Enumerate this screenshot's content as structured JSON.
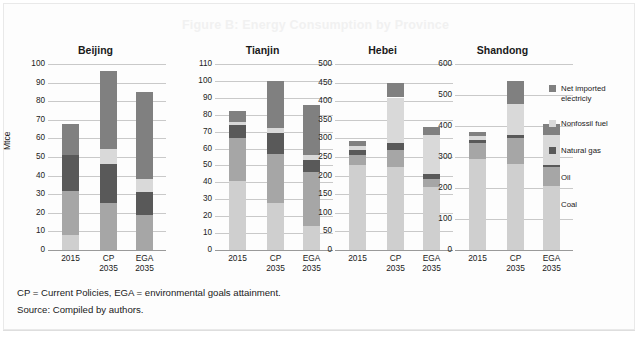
{
  "figure": {
    "title": "Figure B: Energy Consumption by Province",
    "ylabel": "Mtce",
    "note_1": "CP = Current Policies, EGA = environmental goals attainment.",
    "note_2": "Source: Compiled by authors."
  },
  "legend": {
    "items": [
      {
        "label": "Net imported electriciy",
        "color": "#808080"
      },
      {
        "label": "Nonfossil fuel",
        "color": "#d9d9d9"
      },
      {
        "label": "Natural gas",
        "color": "#595959"
      },
      {
        "label": "Oil",
        "color": "#a6a6a6"
      },
      {
        "label": "Coal",
        "color": "#cfcfcf"
      }
    ]
  },
  "chart_data": {
    "type": "bar",
    "title": "Figure B: Energy Consumption by Province",
    "ylabel": "Mtce",
    "xlabel": "",
    "grid": true,
    "legend_position": "right",
    "stacked": true,
    "series_order_bottom_to_top": [
      "Coal",
      "Oil",
      "Natural gas",
      "Nonfossil fuel",
      "Net imported electriciy"
    ],
    "series_colors": {
      "Coal": "#cfcfcf",
      "Oil": "#a6a6a6",
      "Natural gas": "#595959",
      "Nonfossil fuel": "#d9d9d9",
      "Net imported electriciy": "#808080"
    },
    "categories": [
      "2015",
      "CP\n2035",
      "EGA\n2035"
    ],
    "panels": [
      {
        "name": "Beijing",
        "ylim": [
          0,
          100
        ],
        "ystep": 10,
        "yticks": [
          0,
          10,
          20,
          30,
          40,
          50,
          60,
          70,
          80,
          90,
          100
        ],
        "bars": [
          {
            "category": "2015",
            "total": 68,
            "segments": [
              {
                "name": "Coal",
                "value": 8
              },
              {
                "name": "Oil",
                "value": 23.5
              },
              {
                "name": "Natural gas",
                "value": 19.5
              },
              {
                "name": "Nonfossil fuel",
                "value": 0
              },
              {
                "name": "Net imported electriciy",
                "value": 17
              }
            ]
          },
          {
            "category": "CP\n2035",
            "total": 96,
            "segments": [
              {
                "name": "Coal",
                "value": 0
              },
              {
                "name": "Oil",
                "value": 25.5
              },
              {
                "name": "Natural gas",
                "value": 21
              },
              {
                "name": "Nonfossil fuel",
                "value": 8
              },
              {
                "name": "Net imported electriciy",
                "value": 41.5
              }
            ]
          },
          {
            "category": "EGA\n2035",
            "total": 85,
            "segments": [
              {
                "name": "Coal",
                "value": 0
              },
              {
                "name": "Oil",
                "value": 19
              },
              {
                "name": "Natural gas",
                "value": 12
              },
              {
                "name": "Nonfossil fuel",
                "value": 7
              },
              {
                "name": "Net imported electriciy",
                "value": 47
              }
            ]
          }
        ]
      },
      {
        "name": "Tianjin",
        "ylim": [
          0,
          110
        ],
        "ystep": 10,
        "yticks": [
          0,
          10,
          20,
          30,
          40,
          50,
          60,
          70,
          80,
          90,
          100,
          110
        ],
        "bars": [
          {
            "category": "2015",
            "total": 82,
            "segments": [
              {
                "name": "Coal",
                "value": 41
              },
              {
                "name": "Oil",
                "value": 25
              },
              {
                "name": "Natural gas",
                "value": 8
              },
              {
                "name": "Nonfossil fuel",
                "value": 2
              },
              {
                "name": "Net imported electriciy",
                "value": 6
              }
            ]
          },
          {
            "category": "CP\n2035",
            "total": 100,
            "segments": [
              {
                "name": "Coal",
                "value": 28
              },
              {
                "name": "Oil",
                "value": 29
              },
              {
                "name": "Natural gas",
                "value": 12
              },
              {
                "name": "Nonfossil fuel",
                "value": 3
              },
              {
                "name": "Net imported electriciy",
                "value": 28
              }
            ]
          },
          {
            "category": "EGA\n2035",
            "total": 86,
            "segments": [
              {
                "name": "Coal",
                "value": 14
              },
              {
                "name": "Oil",
                "value": 32
              },
              {
                "name": "Natural gas",
                "value": 7
              },
              {
                "name": "Nonfossil fuel",
                "value": 3
              },
              {
                "name": "Net imported electriciy",
                "value": 30
              }
            ]
          }
        ]
      },
      {
        "name": "Hebei",
        "ylim": [
          0,
          500
        ],
        "ystep": 50,
        "yticks": [
          0,
          50,
          100,
          150,
          200,
          250,
          300,
          350,
          400,
          450,
          500
        ],
        "bars": [
          {
            "category": "2015",
            "total": 292,
            "segments": [
              {
                "name": "Coal",
                "value": 228
              },
              {
                "name": "Oil",
                "value": 27
              },
              {
                "name": "Natural gas",
                "value": 13
              },
              {
                "name": "Nonfossil fuel",
                "value": 11
              },
              {
                "name": "Net imported electriciy",
                "value": 13
              }
            ]
          },
          {
            "category": "CP\n2035",
            "total": 448,
            "segments": [
              {
                "name": "Coal",
                "value": 222
              },
              {
                "name": "Oil",
                "value": 48
              },
              {
                "name": "Natural gas",
                "value": 18
              },
              {
                "name": "Nonfossil fuel",
                "value": 122
              },
              {
                "name": "Net imported electriciy",
                "value": 38
              }
            ]
          },
          {
            "category": "EGA\n2035",
            "total": 330,
            "segments": [
              {
                "name": "Coal",
                "value": 170
              },
              {
                "name": "Oil",
                "value": 22
              },
              {
                "name": "Natural gas",
                "value": 12
              },
              {
                "name": "Nonfossil fuel",
                "value": 106
              },
              {
                "name": "Net imported electriciy",
                "value": 20
              }
            ]
          }
        ]
      },
      {
        "name": "Shandong",
        "ylim": [
          0,
          600
        ],
        "ystep": 100,
        "yticks": [
          0,
          100,
          200,
          300,
          400,
          500,
          600
        ],
        "bars": [
          {
            "category": "2015",
            "total": 380,
            "segments": [
              {
                "name": "Coal",
                "value": 292
              },
              {
                "name": "Oil",
                "value": 52
              },
              {
                "name": "Natural gas",
                "value": 10
              },
              {
                "name": "Nonfossil fuel",
                "value": 14
              },
              {
                "name": "Net imported electriciy",
                "value": 12
              }
            ]
          },
          {
            "category": "CP\n2035",
            "total": 544,
            "segments": [
              {
                "name": "Coal",
                "value": 276
              },
              {
                "name": "Oil",
                "value": 84
              },
              {
                "name": "Natural gas",
                "value": 12
              },
              {
                "name": "Nonfossil fuel",
                "value": 98
              },
              {
                "name": "Net imported electriciy",
                "value": 74
              }
            ]
          },
          {
            "category": "EGA\n2035",
            "total": 406,
            "segments": [
              {
                "name": "Coal",
                "value": 206
              },
              {
                "name": "Oil",
                "value": 62
              },
              {
                "name": "Natural gas",
                "value": 6
              },
              {
                "name": "Nonfossil fuel",
                "value": 98
              },
              {
                "name": "Net imported electriciy",
                "value": 34
              }
            ]
          }
        ]
      }
    ]
  }
}
